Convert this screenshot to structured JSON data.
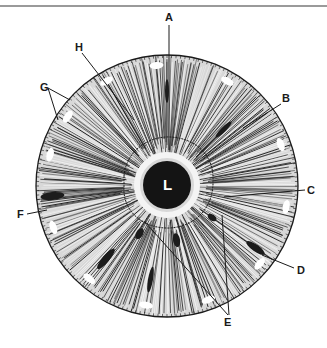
{
  "figure": {
    "type": "iris-diagram",
    "pupil_label": "L",
    "labels": [
      {
        "id": "A",
        "text": "A",
        "x": 165,
        "y": 12
      },
      {
        "id": "B",
        "text": "B",
        "x": 282,
        "y": 93
      },
      {
        "id": "C",
        "text": "C",
        "x": 307,
        "y": 185
      },
      {
        "id": "D",
        "text": "D",
        "x": 297,
        "y": 265
      },
      {
        "id": "E",
        "text": "E",
        "x": 226,
        "y": 318
      },
      {
        "id": "F",
        "text": "F",
        "x": 17,
        "y": 211
      },
      {
        "id": "G",
        "text": "G",
        "x": 40,
        "y": 84
      },
      {
        "id": "H",
        "text": "H",
        "x": 75,
        "y": 43
      }
    ],
    "colors": {
      "ink": "#1a1a1a",
      "paper": "#ffffff",
      "rule": "#9a9a9a"
    }
  }
}
